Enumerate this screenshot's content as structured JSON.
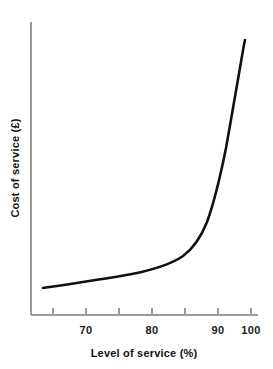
{
  "chart_data": {
    "type": "line",
    "title": "",
    "xlabel": "Level of service (%)",
    "ylabel": "Cost of service (£)",
    "xlim": [
      63,
      101
    ],
    "ylim": [
      0,
      100
    ],
    "grid": false,
    "legend": false,
    "x_ticks": [
      65,
      70,
      75,
      80,
      85,
      90,
      95,
      100
    ],
    "x_tick_labels": [
      "",
      "70",
      "",
      "80",
      "",
      "90",
      "",
      "100"
    ],
    "y_ticks": [],
    "y_tick_labels": [],
    "series": [
      {
        "name": "Cost of service",
        "x": [
          64,
          68,
          72,
          76,
          80,
          84,
          87,
          90,
          92,
          94,
          95.5,
          97,
          98,
          98.6
        ],
        "y": [
          6,
          8,
          10,
          13,
          16,
          21,
          26,
          34,
          42,
          55,
          66,
          80,
          91,
          97
        ]
      }
    ],
    "curve_path": "M 43,288 C 70,284 104,279 132,274 C 152,270 170,265 183,256 C 194,248 201,237 207,222 C 214,203 220,178 226,148 C 231,120 237,85 241,62 C 243,50 244,44 245,40",
    "annotations": [],
    "colors": {
      "curve": "#111111",
      "axis": "#9a9a9a",
      "text": "#111111",
      "background": "#ffffff"
    }
  },
  "axes": {
    "x_axis_name": "x-axis",
    "y_axis_name": "y-axis"
  }
}
